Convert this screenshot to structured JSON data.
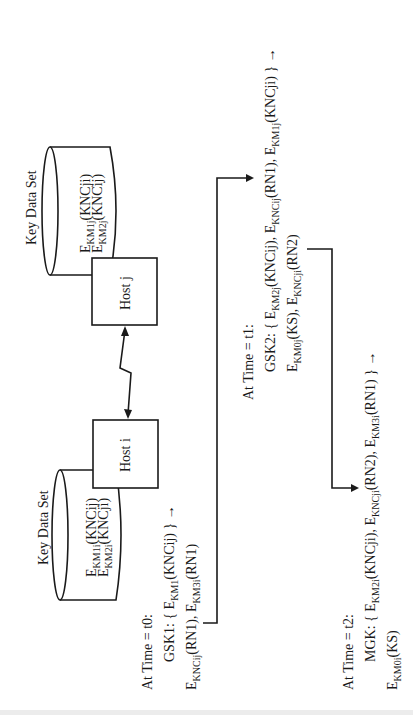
{
  "diagram": {
    "orientation": "rotated 90deg counterclockwise",
    "hosts": [
      {
        "id": "host-j",
        "label": "Host j",
        "key_data_set": {
          "title": "Key Data Set",
          "entries": [
            {
              "base": "E",
              "sub": "KM1j",
              "arg": "(KNCji)"
            },
            {
              "base": "E",
              "sub": "KM2j",
              "arg": "(KNCij)"
            }
          ]
        }
      },
      {
        "id": "host-i",
        "label": "Host i",
        "key_data_set": {
          "title": "Key Data Set",
          "entries": [
            {
              "base": "E",
              "sub": "KM1i",
              "arg": "(KNCij)"
            },
            {
              "base": "E",
              "sub": "KM2i",
              "arg": "(KNCji)"
            }
          ]
        }
      }
    ],
    "link": {
      "type": "communication-link",
      "label": ""
    },
    "steps": [
      {
        "time_label": "At Time = t0:",
        "lines": [
          "GSK1: { E_KM1(KNCij) } →",
          "E_KNCij(RN1), E_KM3i(RN1)"
        ]
      },
      {
        "time_label": "At Time = t1:",
        "lines": [
          "GSK2: { E_KM2j(KNCij), E_KNCij(RN1), E_KM1j(KNCji) } →",
          "E_KM0j(KS), E_KNCji(RN2)"
        ]
      },
      {
        "time_label": "At Time = t2:",
        "lines": [
          "MGK: { E_KM2i(KNCji), E_KNCji(RN2), E_KM3i(RN1) } →",
          "E_KM0i(KS)"
        ]
      }
    ],
    "text": {
      "kds_title": "Key Data Set",
      "host_j": "Host j",
      "host_i": "Host i",
      "t0": "At Time = t0:",
      "t1": "At Time = t1:",
      "t2": "At Time = t2:",
      "E": "E",
      "KM1j": "KM1j",
      "KM2j": "KM2j",
      "KM1i": "KM1i",
      "KM2i": "KM2i",
      "KNCji_p": "(KNCji)",
      "KNCij_p": "(KNCij)",
      "gsk1": "GSK1: { ",
      "KM1": "KM1",
      "close_arrow": ") } →",
      "KNCij": "KNCij",
      "RN1_p": "(RN1), ",
      "KM3i": "KM3i",
      "RN1_end": "(RN1)",
      "gsk2": "GSK2: { ",
      "KNCij_c": "(KNCij), ",
      "KNCji_tail": "(KNCji) } →",
      "KM0j": "KM0j",
      "KS_c": "(KS), ",
      "KNCji": "KNCji",
      "RN2_end": "(RN2)",
      "mgk": "MGK: { ",
      "KNCji_c": "(KNCji), ",
      "RN2_c": "(RN2), ",
      "RN1_tail": "(RN1) } →",
      "KM0i": "KM0i",
      "KS_end": "(KS)",
      "KNCij_open": "(KNCij"
    }
  }
}
